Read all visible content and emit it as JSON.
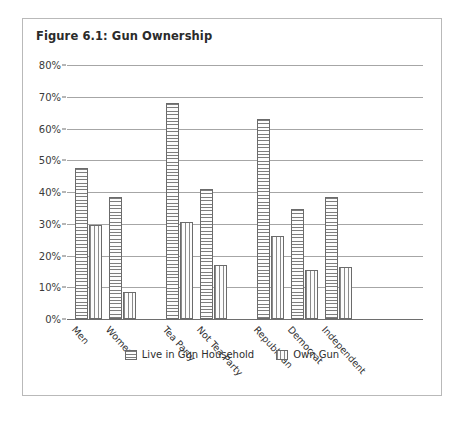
{
  "figure": {
    "title": "Figure 6.1: Gun Ownership",
    "frame_color": "#b9b9b9"
  },
  "chart_data": {
    "type": "bar",
    "title": "Figure 6.1: Gun Ownership",
    "xlabel": "",
    "ylabel": "",
    "ylim": [
      0,
      80
    ],
    "ytick_values": [
      0,
      10,
      20,
      30,
      40,
      50,
      60,
      70,
      80
    ],
    "ytick_labels": [
      "0%",
      "10%",
      "20%",
      "30%",
      "40%",
      "50%",
      "60%",
      "70%",
      "80%"
    ],
    "grid": true,
    "legend_position": "bottom",
    "categories": [
      "Men",
      "Women",
      "Tea Party",
      "Not Tea Party",
      "Republican",
      "Democrat",
      "Independent"
    ],
    "group_breaks_after": [
      "Women",
      "Not Tea Party"
    ],
    "series": [
      {
        "name": "Live in Gun Household",
        "pattern": "horizontal-hatch",
        "values": [
          47.5,
          38.5,
          68.0,
          41.0,
          63.0,
          34.5,
          38.5
        ]
      },
      {
        "name": "Own Gun",
        "pattern": "vertical-hatch",
        "values": [
          29.5,
          8.5,
          30.5,
          17.0,
          26.0,
          15.5,
          16.5
        ]
      }
    ]
  }
}
